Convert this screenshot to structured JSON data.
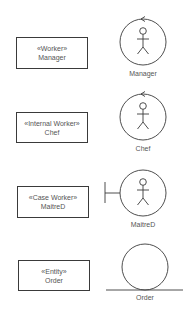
{
  "diagram": {
    "rows": [
      {
        "stereotype": "«Worker»",
        "name": "Manager",
        "icon": "worker-actor-icon",
        "icon_label": "Manager"
      },
      {
        "stereotype": "«Internal Worker»",
        "name": "Chef",
        "icon": "internal-worker-actor-icon",
        "icon_label": "Chef"
      },
      {
        "stereotype": "«Case Worker»",
        "name": "MaitreD",
        "icon": "case-worker-boundary-icon",
        "icon_label": "MaitreD"
      },
      {
        "stereotype": "«Entity»",
        "name": "Order",
        "icon": "entity-icon",
        "icon_label": "Order"
      }
    ]
  },
  "colors": {
    "stroke": "#3a3a3a",
    "text": "#555555",
    "background": "#ffffff"
  }
}
